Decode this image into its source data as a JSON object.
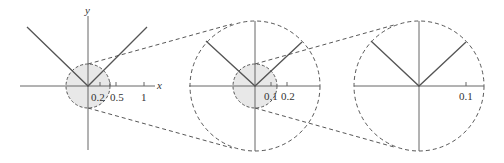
{
  "figure": {
    "colors": {
      "line": "#555555",
      "axis": "#666666",
      "dash": "#444444",
      "shade": "#e8e8e8"
    },
    "panels": [
      {
        "id": "panel-1",
        "axis_labels": {
          "x": "x",
          "y": "y"
        },
        "tick_labels": [
          "0.2",
          "0.5",
          "1"
        ]
      },
      {
        "id": "panel-2",
        "tick_labels": [
          "0.1",
          "0.2"
        ]
      },
      {
        "id": "panel-3",
        "tick_labels": [
          "0.1"
        ]
      }
    ]
  }
}
